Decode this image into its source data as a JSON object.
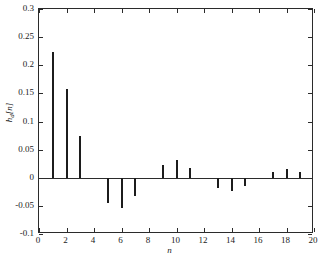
{
  "chart_data": {
    "type": "bar",
    "title": "",
    "subtitle": "",
    "xlabel": "n",
    "ylabel": "h_d[n]",
    "ylabel_base": "h",
    "ylabel_sub": "d",
    "ylabel_tail": "[n]",
    "xlim": [
      0,
      20
    ],
    "ylim": [
      -0.1,
      0.3
    ],
    "grid": false,
    "legend": null,
    "xticks": [
      0,
      2,
      4,
      6,
      8,
      10,
      12,
      14,
      16,
      18,
      20
    ],
    "xtick_labels": [
      "0",
      "2",
      "4",
      "6",
      "8",
      "10",
      "12",
      "14",
      "16",
      "18",
      "20"
    ],
    "yticks": [
      0.3,
      0.25,
      0.2,
      0.15,
      0.1,
      0.05,
      0,
      -0.05,
      -0.1
    ],
    "ytick_labels": [
      "0.3",
      "0.25",
      "0.2",
      "0.15",
      "0.1",
      "0.05",
      "0",
      "-0.05",
      "-0.1"
    ],
    "x": [
      0,
      1,
      2,
      3,
      4,
      5,
      6,
      7,
      8,
      9,
      10,
      11,
      12,
      13,
      14,
      15,
      16,
      17,
      18,
      19,
      20
    ],
    "values": [
      0,
      0.224,
      0.158,
      0.075,
      0,
      -0.045,
      -0.053,
      -0.033,
      0,
      0.023,
      0.031,
      0.017,
      0,
      -0.018,
      -0.023,
      -0.014,
      0,
      0.011,
      0.016,
      0.01,
      0
    ],
    "series": [
      {
        "name": "h_d[n]",
        "values": [
          0,
          0.224,
          0.158,
          0.075,
          0,
          -0.045,
          -0.053,
          -0.033,
          0,
          0.023,
          0.031,
          0.017,
          0,
          -0.018,
          -0.023,
          -0.014,
          0,
          0.011,
          0.016,
          0.01,
          0
        ]
      }
    ],
    "bar_color": "#1c1c1c",
    "axis_color": "#2b2b2b",
    "background": "#ffffff"
  },
  "caption": {
    "text": ""
  }
}
